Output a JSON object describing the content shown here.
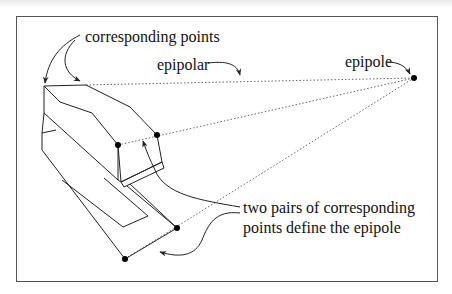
{
  "figure": {
    "labels": {
      "corresponding_points": "corresponding points",
      "epipolar": "epipolar",
      "epipole": "epipole",
      "two_pairs_line1": "two pairs of corresponding",
      "two_pairs_line2": "points define the epipole"
    },
    "colors": {
      "stroke": "#222222",
      "frame": "#555555",
      "dotted": "#666666",
      "point": "#000000",
      "background": "#ffffff"
    },
    "epipole_point": {
      "x": 414,
      "y": 78
    },
    "corresponding_point_pairs": [
      {
        "a": {
          "x": 118,
          "y": 145
        },
        "b": {
          "x": 157,
          "y": 135
        }
      },
      {
        "a": {
          "x": 125,
          "y": 259
        },
        "b": {
          "x": 177,
          "y": 228
        }
      }
    ]
  }
}
